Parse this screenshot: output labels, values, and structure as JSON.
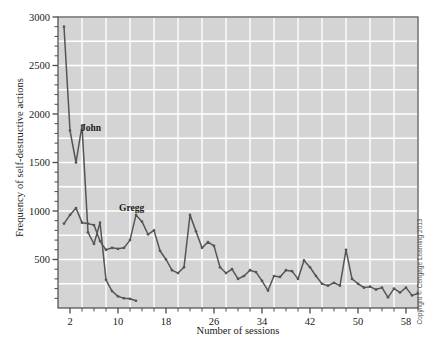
{
  "chart_data": {
    "type": "line",
    "title": "",
    "xlabel": "Number of sessions",
    "ylabel": "Frequency of self-destructive actions",
    "xlim": [
      0,
      60
    ],
    "ylim": [
      0,
      3000
    ],
    "grid": true,
    "legend_position": "inline-annotation",
    "x_tick_labels": [
      "2",
      "10",
      "18",
      "26",
      "34",
      "42",
      "50",
      "58"
    ],
    "x_tick_values": [
      2,
      10,
      18,
      26,
      34,
      42,
      50,
      58
    ],
    "x_minor_tick_step": 2,
    "y_tick_labels": [
      "500",
      "1000",
      "1500",
      "2000",
      "2500",
      "3000"
    ],
    "y_tick_values": [
      500,
      1000,
      1500,
      2000,
      2500,
      3000
    ],
    "y_minor_tick_step": 100,
    "y_gridline_step": 250,
    "x_gridline_step": 4,
    "series": [
      {
        "name": "John",
        "color": "#555555",
        "x": [
          1,
          2,
          3,
          4,
          5,
          6,
          7,
          8,
          9,
          10,
          11,
          12,
          13
        ],
        "values": [
          2900,
          1830,
          1500,
          1880,
          780,
          660,
          880,
          290,
          175,
          120,
          100,
          95,
          75
        ]
      },
      {
        "name": "Gregg",
        "color": "#555555",
        "x": [
          1,
          2,
          3,
          4,
          5,
          6,
          7,
          8,
          9,
          10,
          11,
          12,
          13,
          14,
          15,
          16,
          17,
          18,
          19,
          20,
          21,
          22,
          23,
          24,
          25,
          26,
          27,
          28,
          29,
          30,
          31,
          32,
          33,
          34,
          35,
          36,
          37,
          38,
          39,
          40,
          41,
          42,
          43,
          44,
          45,
          46,
          47,
          48,
          49,
          50,
          51,
          52,
          53,
          54,
          55,
          56,
          57,
          58,
          59,
          60
        ],
        "values": [
          870,
          960,
          1030,
          880,
          870,
          855,
          690,
          600,
          620,
          610,
          620,
          700,
          960,
          890,
          760,
          800,
          590,
          500,
          390,
          360,
          420,
          960,
          790,
          620,
          680,
          640,
          420,
          360,
          400,
          300,
          330,
          390,
          370,
          280,
          180,
          330,
          320,
          390,
          380,
          300,
          490,
          420,
          330,
          250,
          230,
          260,
          230,
          600,
          300,
          250,
          210,
          220,
          190,
          210,
          110,
          200,
          160,
          210,
          130,
          150
        ]
      }
    ],
    "annotations": [
      {
        "text": "John",
        "x": 4,
        "y": 1880
      },
      {
        "text": "Gregg",
        "x": 13,
        "y": 960
      }
    ]
  },
  "copyright": {
    "text": "Copyright © Cengage Learning 2013"
  },
  "colors": {
    "plot_background": "#d4d4d4",
    "gridline": "#ffffff",
    "axis": "#4a4a4a",
    "line": "#555555",
    "text": "#1a1a1a"
  }
}
